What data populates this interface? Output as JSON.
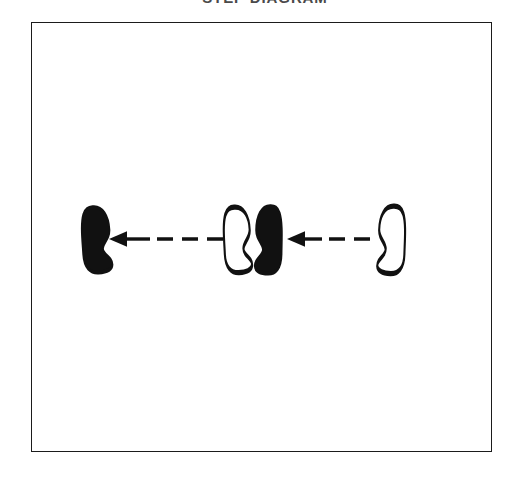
{
  "figure": {
    "title": "STEP DIAGRAM",
    "title_visible_partially": true,
    "background_color": "#ffffff",
    "ink_color": "#1b1b1b",
    "frame": {
      "name": "diagram-frame",
      "x": 31,
      "y": 22,
      "width": 461,
      "height": 430,
      "border_color": "#1b1b1b",
      "border_width": 1.6,
      "fill": "#ffffff"
    }
  },
  "diagram": {
    "type": "footprint-step-diagram",
    "direction": "right-to-left",
    "footprints": [
      {
        "index": 1,
        "label": "footprint-1-filled-left-most",
        "fill": "solid",
        "fill_color": "#111111",
        "stroke_color": "#111111",
        "foot": "right",
        "arch_side": "right",
        "cx": 96,
        "cy": 239,
        "width": 30,
        "height": 68,
        "rotation": -6
      },
      {
        "index": 2,
        "label": "footprint-2-outline-middle-left",
        "fill": "outline",
        "fill_color": "#ffffff",
        "stroke_color": "#111111",
        "foot": "right",
        "arch_side": "right",
        "cx": 237,
        "cy": 239,
        "width": 28,
        "height": 68,
        "rotation": -5
      },
      {
        "index": 3,
        "label": "footprint-3-filled-middle-right",
        "fill": "solid",
        "fill_color": "#111111",
        "stroke_color": "#111111",
        "foot": "left",
        "arch_side": "left",
        "cx": 269,
        "cy": 239,
        "width": 28,
        "height": 70,
        "rotation": 3
      },
      {
        "index": 4,
        "label": "footprint-4-outline-right-most",
        "fill": "outline",
        "fill_color": "#ffffff",
        "stroke_color": "#111111",
        "foot": "left",
        "arch_side": "left",
        "cx": 392,
        "cy": 239,
        "width": 28,
        "height": 70,
        "rotation": 4
      }
    ],
    "arrows": [
      {
        "index": 1,
        "label": "arrow-left-segment",
        "style": "dashed",
        "points_to": "left",
        "from_x": 231,
        "to_x": 109,
        "y": 239,
        "color": "#111111",
        "line_width": 3.4,
        "dash_count": 4
      },
      {
        "index": 2,
        "label": "arrow-right-segment",
        "style": "dashed",
        "points_to": "left",
        "from_x": 376,
        "to_x": 287,
        "y": 239,
        "color": "#111111",
        "line_width": 3.4,
        "dash_count": 3
      }
    ]
  }
}
